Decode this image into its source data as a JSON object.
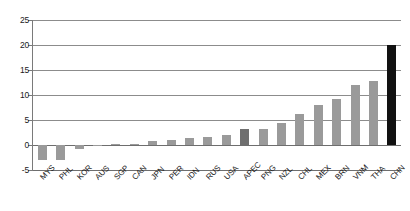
{
  "chart_data": {
    "type": "bar",
    "title": "",
    "subtitle": "",
    "xlabel": "",
    "ylabel": "",
    "ylim": [
      -5,
      25
    ],
    "ytick_values": [
      25,
      20,
      15,
      10,
      5,
      0,
      -5
    ],
    "ytick_labels": [
      "25",
      "20",
      "15",
      "10",
      "5",
      "0",
      "-5"
    ],
    "grid": true,
    "legend": "none",
    "categories": [
      "MYS",
      "PHL",
      "KOR",
      "AUS",
      "SGP",
      "CAN",
      "JPN",
      "PER",
      "IDN",
      "RUS",
      "USA",
      "APEC",
      "PNG",
      "NZL",
      "CHL",
      "MEX",
      "BRN",
      "VNM",
      "THA",
      "CHN"
    ],
    "values": [
      -3.0,
      -3.0,
      -0.7,
      0.1,
      0.2,
      0.3,
      0.8,
      1.1,
      1.4,
      1.7,
      2.1,
      3.2,
      3.3,
      4.4,
      6.2,
      8.0,
      9.2,
      12.1,
      12.8,
      20.0
    ],
    "bar_colors": [
      "#9a9a9a",
      "#9a9a9a",
      "#9a9a9a",
      "#9a9a9a",
      "#9a9a9a",
      "#9a9a9a",
      "#9a9a9a",
      "#9a9a9a",
      "#9a9a9a",
      "#9a9a9a",
      "#9a9a9a",
      "#6f6f6f",
      "#9a9a9a",
      "#9a9a9a",
      "#9a9a9a",
      "#9a9a9a",
      "#9a9a9a",
      "#9a9a9a",
      "#9a9a9a",
      "#111111"
    ],
    "highlight_categories": [
      "APEC",
      "CHN"
    ],
    "colors": {
      "bar_default": "#9a9a9a",
      "bar_aggregate": "#6f6f6f",
      "bar_highlight": "#111111",
      "gridline": "#8c8c8c",
      "axis": "#7a7a7a",
      "text": "#1a1a1a",
      "background": "#ffffff"
    }
  }
}
